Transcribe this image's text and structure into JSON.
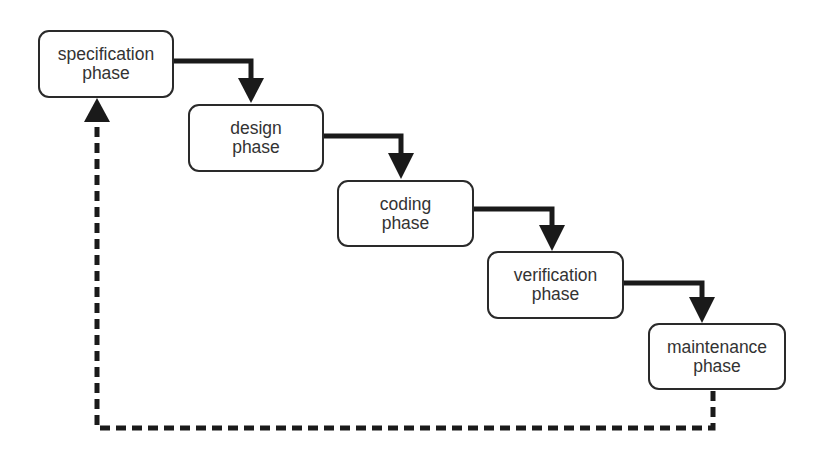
{
  "diagram": {
    "type": "waterfall-model",
    "colors": {
      "stroke": "#1a1a1a",
      "box_border": "#2a2a2a",
      "text": "#333333",
      "background": "#ffffff"
    },
    "phases": [
      {
        "line1": "specification",
        "line2": "phase"
      },
      {
        "line1": "design",
        "line2": "phase"
      },
      {
        "line1": "coding",
        "line2": "phase"
      },
      {
        "line1": "verification",
        "line2": "phase"
      },
      {
        "line1": "maintenance",
        "line2": "phase"
      }
    ],
    "edges": [
      {
        "from": "specification phase",
        "to": "design phase",
        "style": "solid"
      },
      {
        "from": "design phase",
        "to": "coding phase",
        "style": "solid"
      },
      {
        "from": "coding phase",
        "to": "verification phase",
        "style": "solid"
      },
      {
        "from": "verification phase",
        "to": "maintenance phase",
        "style": "solid"
      },
      {
        "from": "maintenance phase",
        "to": "specification phase",
        "style": "dashed"
      }
    ]
  }
}
